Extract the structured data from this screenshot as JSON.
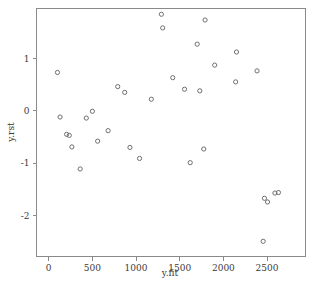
{
  "chart_data": {
    "type": "scatter",
    "title": "",
    "xlabel": "y.fit",
    "ylabel": "y.rst",
    "xlim": [
      -140,
      2940
    ],
    "ylim": [
      -2.78,
      1.95
    ],
    "xticks": [
      0,
      500,
      1000,
      1500,
      2000,
      2500
    ],
    "xtick_labels": [
      "0",
      "500",
      "1000",
      "1500",
      "2000",
      "2500"
    ],
    "yticks": [
      1,
      0,
      -1,
      -2
    ],
    "ytick_labels": [
      "1",
      "0",
      "-1",
      "-2"
    ],
    "grid": false,
    "legend": null,
    "marker": "open-circle",
    "marker_color": "#6f6f6f",
    "frame_color": "#8a8a8a",
    "points": [
      {
        "x": 100,
        "y": 0.73
      },
      {
        "x": 130,
        "y": -0.12
      },
      {
        "x": 205,
        "y": -0.45
      },
      {
        "x": 235,
        "y": -0.47
      },
      {
        "x": 265,
        "y": -0.69
      },
      {
        "x": 360,
        "y": -1.11
      },
      {
        "x": 430,
        "y": -0.14
      },
      {
        "x": 500,
        "y": -0.01
      },
      {
        "x": 560,
        "y": -0.58
      },
      {
        "x": 680,
        "y": -0.38
      },
      {
        "x": 790,
        "y": 0.46
      },
      {
        "x": 870,
        "y": 0.35
      },
      {
        "x": 930,
        "y": -0.7
      },
      {
        "x": 1040,
        "y": -0.91
      },
      {
        "x": 1175,
        "y": 0.22
      },
      {
        "x": 1290,
        "y": 1.84
      },
      {
        "x": 1305,
        "y": 1.58
      },
      {
        "x": 1420,
        "y": 0.63
      },
      {
        "x": 1555,
        "y": 0.41
      },
      {
        "x": 1620,
        "y": -0.99
      },
      {
        "x": 1700,
        "y": 1.27
      },
      {
        "x": 1730,
        "y": 0.38
      },
      {
        "x": 1775,
        "y": -0.73
      },
      {
        "x": 1790,
        "y": 1.73
      },
      {
        "x": 1900,
        "y": 0.87
      },
      {
        "x": 2140,
        "y": 0.55
      },
      {
        "x": 2150,
        "y": 1.12
      },
      {
        "x": 2385,
        "y": 0.76
      },
      {
        "x": 2455,
        "y": -2.49
      },
      {
        "x": 2470,
        "y": -1.67
      },
      {
        "x": 2505,
        "y": -1.74
      },
      {
        "x": 2590,
        "y": -1.57
      },
      {
        "x": 2630,
        "y": -1.56
      }
    ]
  }
}
